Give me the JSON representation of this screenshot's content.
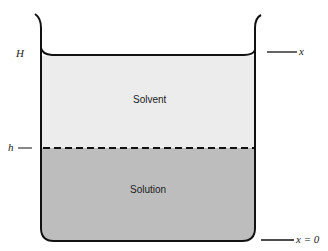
{
  "diagram": {
    "type": "beaker-cross-section",
    "regions": [
      {
        "name": "solvent",
        "label": "Solvent",
        "color": "#ececec"
      },
      {
        "name": "solution",
        "label": "Solution",
        "color": "#bdbdbd"
      }
    ],
    "labels": {
      "top_height": "H",
      "interface_height": "h",
      "top_position": "x",
      "bottom_position": "x = 0"
    },
    "line_color": "#111111"
  }
}
